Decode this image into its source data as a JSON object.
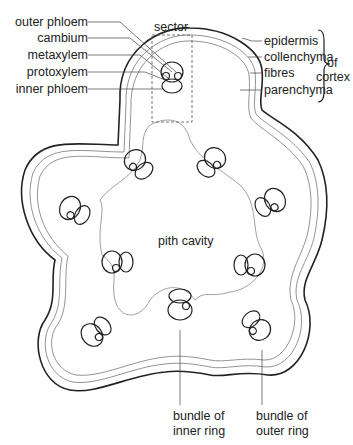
{
  "title_partial": "",
  "labels": {
    "outer_phloem": "outer phloem",
    "cambium": "cambium",
    "metaxylem": "metaxylem",
    "protoxylem": "protoxylem",
    "inner_phloem": "inner phloem",
    "sector": "sector",
    "epidermis": "epidermis",
    "collenchyma": "collenchyma",
    "fibres": "fibres",
    "parenchyma": "parenchyma",
    "of_cortex_1": "of",
    "of_cortex_2": "cortex",
    "pith_cavity": "pith cavity",
    "bundle_inner_1": "bundle of",
    "bundle_inner_2": "inner ring",
    "bundle_outer_1": "bundle of",
    "bundle_outer_2": "outer ring"
  },
  "colors": {
    "ink": "#222222",
    "thin_line": "#777777",
    "background": "#ffffff"
  }
}
